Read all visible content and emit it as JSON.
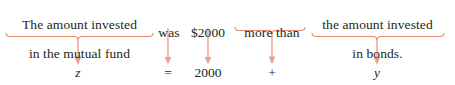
{
  "figure": {
    "background_color": "#ffffff",
    "text_color": "#231f20",
    "connector_color": "#e08a72"
  },
  "mapping": [
    {
      "id": "z-term",
      "phrase_lines": [
        "The amount invested",
        "in the mutual fund"
      ],
      "symbol": "z",
      "symbol_style": "italic",
      "connector": "brace",
      "phrase_box": {
        "left": 2,
        "top": 4,
        "width": 155
      },
      "brace": {
        "x1": 6,
        "x2": 153,
        "y": 36,
        "stem_x": 78
      },
      "arrow": {
        "x": 78,
        "y1": 41,
        "y2": 64
      },
      "symbol_pos": {
        "center_x": 78,
        "top": 67
      }
    },
    {
      "id": "equals-term",
      "phrase_lines": [
        "was"
      ],
      "symbol": "=",
      "symbol_style": "roman",
      "connector": "line",
      "phrase_box": {
        "left": 156,
        "top": 11,
        "width": 26
      },
      "brace": {
        "x1": 168,
        "x2": 168,
        "y": 28,
        "stem_x": 168
      },
      "arrow": {
        "x": 168,
        "y1": 28,
        "y2": 64
      },
      "symbol_pos": {
        "center_x": 168,
        "top": 67
      }
    },
    {
      "id": "constant-term",
      "phrase_lines": [
        "$2000"
      ],
      "symbol": "2000",
      "symbol_style": "roman",
      "connector": "line",
      "phrase_box": {
        "left": 186,
        "top": 11,
        "width": 46
      },
      "brace": {
        "x1": 208,
        "x2": 208,
        "y": 28,
        "stem_x": 208
      },
      "arrow": {
        "x": 208,
        "y1": 28,
        "y2": 64
      },
      "symbol_pos": {
        "center_x": 208,
        "top": 67
      }
    },
    {
      "id": "plus-term",
      "phrase_lines": [
        "more than"
      ],
      "symbol": "+",
      "symbol_style": "roman",
      "connector": "brace",
      "phrase_box": {
        "left": 234,
        "top": 11,
        "width": 72
      },
      "brace": {
        "x1": 235,
        "x2": 305,
        "y": 30,
        "stem_x": 272
      },
      "arrow": {
        "x": 272,
        "y1": 35,
        "y2": 64
      },
      "symbol_pos": {
        "center_x": 272,
        "top": 67
      }
    },
    {
      "id": "y-term",
      "phrase_lines": [
        "the amount invested",
        "in bonds."
      ],
      "symbol": "y",
      "symbol_style": "italic",
      "connector": "brace",
      "phrase_box": {
        "left": 300,
        "top": 4,
        "width": 155
      },
      "brace": {
        "x1": 312,
        "x2": 444,
        "y": 36,
        "stem_x": 377
      },
      "arrow": {
        "x": 377,
        "y1": 41,
        "y2": 64
      },
      "symbol_pos": {
        "center_x": 377,
        "top": 67
      }
    }
  ],
  "equation_reading": "z = 2000 + y"
}
